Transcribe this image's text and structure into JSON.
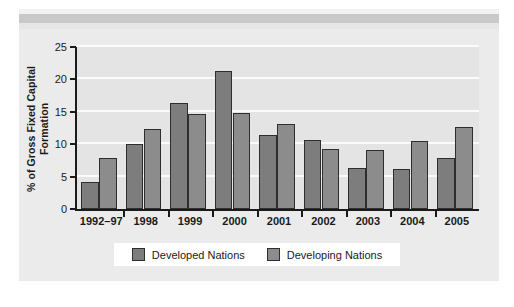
{
  "chart_data": {
    "type": "bar",
    "title": "",
    "xlabel": "",
    "ylabel": "% of Gross Fixed Capital Formation",
    "categories": [
      "1992–97",
      "1998",
      "1999",
      "2000",
      "2001",
      "2002",
      "2003",
      "2004",
      "2005"
    ],
    "series": [
      {
        "name": "Developed Nations",
        "color": "#7d7d7d",
        "values": [
          4.1,
          10.0,
          16.3,
          21.3,
          11.4,
          10.6,
          6.3,
          6.1,
          7.9
        ]
      },
      {
        "name": "Developing Nations",
        "color": "#8c8c8c",
        "values": [
          7.8,
          12.3,
          14.7,
          14.8,
          13.1,
          9.3,
          9.1,
          10.5,
          12.7
        ]
      }
    ],
    "ylim": [
      0,
      25
    ],
    "yticks": [
      0,
      5,
      10,
      15,
      20,
      25
    ],
    "ytick_labels": [
      "0",
      "5",
      "10",
      "15",
      "20",
      "25"
    ],
    "grid": true,
    "grid_axis": "y",
    "legend_position": "bottom-center"
  },
  "legend": {
    "entries": [
      {
        "label": "Developed Nations",
        "swatch": "developed"
      },
      {
        "label": "Developing Nations",
        "swatch": "developing"
      }
    ]
  },
  "colors": {
    "page_background": "#ffffff",
    "figure_background": "#ebebeb",
    "plot_background": "#e4e4e4",
    "gridline": "#fbfbfb",
    "axis": "#1a1a1a",
    "bar_developed": "#7d7d7d",
    "bar_developing": "#8c8c8c",
    "bar_outline": "#2e2e2e",
    "legend_background": "#ffffff",
    "scan_band": "#c9c9c9"
  }
}
